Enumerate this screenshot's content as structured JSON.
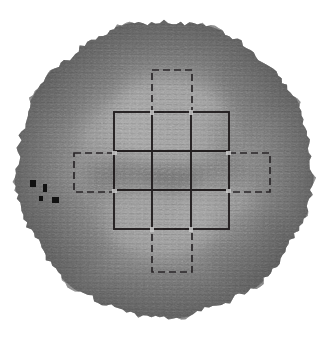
{
  "figure": {
    "caption": "",
    "background_color": "#ffffff"
  },
  "scan": {
    "name": "circular-survey-scan",
    "shape": "circle",
    "center_x": 164,
    "center_y": 169,
    "radius": 148,
    "edge_style": "ragged",
    "texture": "fine horizontal striations",
    "base_tone": "#8a8a8a",
    "light_tone": "#c4c4c4",
    "dark_tone": "#4a4a4a",
    "darkest_tone": "#2e2e2e"
  },
  "intensity_field": {
    "description": "Mottled greyscale intensity across the circular scan area",
    "blobs": [
      {
        "name": "bright-upper-centre",
        "cx": 168,
        "cy": 120,
        "rx": 62,
        "ry": 44,
        "tone": "#c9c9c9",
        "opacity": 0.55
      },
      {
        "name": "bright-left-upper",
        "cx": 120,
        "cy": 128,
        "rx": 40,
        "ry": 34,
        "tone": "#c2c2c2",
        "opacity": 0.45
      },
      {
        "name": "bright-lower-centre",
        "cx": 160,
        "cy": 215,
        "rx": 55,
        "ry": 40,
        "tone": "#c6c6c6",
        "opacity": 0.5
      },
      {
        "name": "bright-right-lower",
        "cx": 222,
        "cy": 214,
        "rx": 38,
        "ry": 30,
        "tone": "#bdbdbd",
        "opacity": 0.42
      },
      {
        "name": "dark-core",
        "cx": 172,
        "cy": 178,
        "rx": 30,
        "ry": 16,
        "tone": "#3a3a3a",
        "opacity": 0.62
      },
      {
        "name": "dark-left-band",
        "cx": 120,
        "cy": 175,
        "rx": 36,
        "ry": 18,
        "tone": "#4f4f4f",
        "opacity": 0.5
      },
      {
        "name": "dark-right-band",
        "cx": 228,
        "cy": 172,
        "rx": 30,
        "ry": 16,
        "tone": "#5a5a5a",
        "opacity": 0.4
      },
      {
        "name": "dark-upper-right",
        "cx": 232,
        "cy": 130,
        "rx": 26,
        "ry": 22,
        "tone": "#5e5e5e",
        "opacity": 0.35
      },
      {
        "name": "dark-rim-upper-left",
        "cx": 78,
        "cy": 86,
        "rx": 46,
        "ry": 40,
        "tone": "#6d6d6d",
        "opacity": 0.4
      },
      {
        "name": "dark-rim-lower-left",
        "cx": 70,
        "cy": 232,
        "rx": 44,
        "ry": 42,
        "tone": "#6a6a6a",
        "opacity": 0.4
      },
      {
        "name": "dark-rim-lower-right",
        "cx": 252,
        "cy": 250,
        "rx": 46,
        "ry": 42,
        "tone": "#676767",
        "opacity": 0.42
      },
      {
        "name": "dark-rim-upper-right",
        "cx": 256,
        "cy": 82,
        "rx": 44,
        "ry": 38,
        "tone": "#6b6b6b",
        "opacity": 0.4
      },
      {
        "name": "dark-bottom-edge",
        "cx": 160,
        "cy": 300,
        "rx": 70,
        "ry": 26,
        "tone": "#6e6e6e",
        "opacity": 0.35
      },
      {
        "name": "dark-top-edge",
        "cx": 160,
        "cy": 38,
        "rx": 72,
        "ry": 24,
        "tone": "#717171",
        "opacity": 0.33
      }
    ]
  },
  "grid_overlay": {
    "name": "cruciform-grid-overlay",
    "solid_block": {
      "label": "central solid 3x3 grid",
      "x": 114,
      "y": 112,
      "width": 115,
      "height": 117,
      "columns": 3,
      "rows": 3,
      "column_divider_x": [
        152,
        191
      ],
      "row_divider_y": [
        151,
        190
      ],
      "stroke_color": "#231f20",
      "stroke_width": 1.9
    },
    "dashed_arms": [
      {
        "name": "north-arm",
        "x": 152,
        "y": 70,
        "width": 40,
        "height": 42,
        "stroke_color": "#2a2628"
      },
      {
        "name": "south-arm",
        "x": 152,
        "y": 229,
        "width": 40,
        "height": 43,
        "stroke_color": "#2a2628"
      },
      {
        "name": "west-arm",
        "x": 74,
        "y": 153,
        "width": 40,
        "height": 39,
        "stroke_color": "#2a2628"
      },
      {
        "name": "east-arm",
        "x": 229,
        "y": 153,
        "width": 41,
        "height": 39,
        "stroke_color": "#2a2628"
      }
    ],
    "dashed_outline_note": "arms drawn with dashed stroke, 7px dash / 4px gap"
  },
  "markers": {
    "name": "dark-square-markers",
    "items": [
      {
        "name": "marker-1",
        "x": 30,
        "y": 180,
        "width": 6,
        "height": 7
      },
      {
        "name": "marker-2",
        "x": 43,
        "y": 184,
        "width": 4,
        "height": 8
      },
      {
        "name": "marker-3",
        "x": 39,
        "y": 196,
        "width": 4,
        "height": 5
      },
      {
        "name": "marker-4",
        "x": 52,
        "y": 197,
        "width": 7,
        "height": 6
      }
    ]
  }
}
